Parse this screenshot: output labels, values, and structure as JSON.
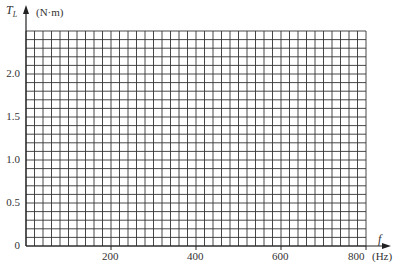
{
  "chart_data": {
    "type": "line",
    "title": "",
    "xlabel": "f",
    "xunit": "(Hz)",
    "ylabel": "T_L",
    "yunit": "(N·m)",
    "xlim": [
      0,
      800
    ],
    "ylim": [
      0,
      2.5
    ],
    "x_ticks": [
      200,
      400,
      600,
      800
    ],
    "x_tick_labels": [
      "200",
      "400",
      "600",
      "800"
    ],
    "y_ticks": [
      0,
      0.5,
      1.0,
      1.5,
      2.0
    ],
    "y_tick_labels": [
      "0",
      "0.5",
      "1.0",
      "1.5",
      "2.0"
    ],
    "grid": true,
    "grid_x_step": 20,
    "grid_y_step": 0.1,
    "series": []
  },
  "labels": {
    "y_axis_symbol": "T",
    "y_axis_subscript": "L",
    "y_axis_unit": "(N·m)",
    "x_axis_symbol": "f",
    "x_axis_unit": "(Hz)",
    "origin": "0"
  },
  "colors": {
    "grid": "#333333",
    "axis": "#222222",
    "background": "#ffffff"
  }
}
